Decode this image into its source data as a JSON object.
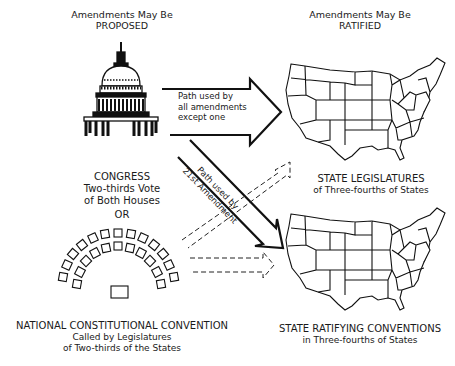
{
  "headers": {
    "proposed": {
      "line1": "Amendments May Be",
      "line2": "PROPOSED"
    },
    "ratified": {
      "line1": "Amendments May Be",
      "line2": "RATIFIED"
    }
  },
  "proposal_methods": {
    "congress": {
      "title": "CONGRESS",
      "line2": "Two-thirds Vote",
      "line3": "of Both Houses",
      "icon": "capitol-dome-icon"
    },
    "separator": "OR",
    "convention": {
      "title": "NATIONAL CONSTITUTIONAL CONVENTION",
      "line2": "Called by Legislatures",
      "line3": "of Two-thirds of the States",
      "icon": "convention-seating-icon"
    }
  },
  "ratification_methods": {
    "legislatures": {
      "title": "STATE LEGISLATURES",
      "line2": "of Three-fourths of States",
      "icon": "us-map-icon"
    },
    "conventions": {
      "title": "STATE RATIFYING CONVENTIONS",
      "line2": "in Three-fourths of States",
      "icon": "us-map-icon"
    }
  },
  "arrows": {
    "main": {
      "line1": "Path used by",
      "line2": "all amendments",
      "line3": "except one",
      "style": "solid"
    },
    "twenty_first": {
      "line1": "Path used by",
      "line2": "21st Amendment",
      "style": "solid"
    },
    "dashed_to_legislatures": {
      "style": "dashed"
    },
    "dashed_to_conventions": {
      "style": "dashed"
    }
  }
}
